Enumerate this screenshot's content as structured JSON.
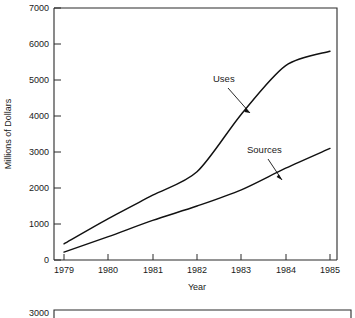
{
  "chart_data": {
    "type": "line",
    "title": "",
    "xlabel": "Year",
    "ylabel": "Millions of Dollars",
    "x": [
      1979,
      1980,
      1981,
      1982,
      1983,
      1984,
      1985
    ],
    "xtick_labels": [
      "1979",
      "1980",
      "1981",
      "1982",
      "1983",
      "1984",
      "1985"
    ],
    "ytick_labels": [
      "0",
      "1000",
      "2000",
      "3000",
      "4000",
      "5000",
      "6000",
      "7000"
    ],
    "ytick_values": [
      0,
      1000,
      2000,
      3000,
      4000,
      5000,
      6000,
      7000
    ],
    "xlim": [
      1979,
      1985
    ],
    "ylim": [
      0,
      7000
    ],
    "grid": false,
    "legend_position": "inline-annotations",
    "series": [
      {
        "name": "Uses",
        "values": [
          450,
          1150,
          1800,
          2450,
          4050,
          5400,
          5800
        ]
      },
      {
        "name": "Sources",
        "values": [
          220,
          650,
          1100,
          1500,
          1950,
          2550,
          3100
        ]
      }
    ],
    "annotations": [
      {
        "text": "Uses",
        "points_to_series": "Uses",
        "at_x": 1983
      },
      {
        "text": "Sources",
        "points_to_series": "Sources",
        "at_x": 1984
      }
    ]
  },
  "second_chart": {
    "visible_ytick_label": "3000"
  }
}
